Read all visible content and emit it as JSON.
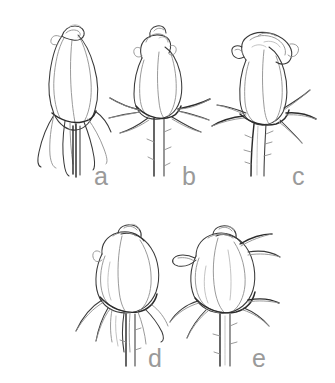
{
  "figure": {
    "kind": "botanical-line-drawing",
    "background_color": "#ffffff",
    "ink_color": "#3a3a3a",
    "soft_ink_color": "#8e8e8e",
    "label_color": "#9a9a9a",
    "panel_count": 5,
    "rows": [
      {
        "row": 1,
        "panels": [
          "a",
          "b",
          "c"
        ]
      },
      {
        "row": 2,
        "panels": [
          "d",
          "e"
        ]
      }
    ]
  },
  "panels": [
    {
      "id": "a",
      "label": "a",
      "stage": "tight elongated bud",
      "description": "slender pointed bud, petals fully closed, long sepals drooping downward along the receptacle",
      "sepals": "reflexed downward, elongate and narrow",
      "stem": "straight, short, no visible thorns",
      "label_x": 96,
      "label_y": 165
    },
    {
      "id": "b",
      "label": "b",
      "stage": "bud with outspread sepals",
      "description": "ovoid bud with petal tips beginning to separate at apex, sepals radiating horizontally outward",
      "sepals": "spreading horizontally, star-like",
      "stem": "straight, thorned",
      "label_x": 182,
      "label_y": 165
    },
    {
      "id": "c",
      "label": "c",
      "stage": "opening bud, outer petals reflexing",
      "description": "outer petals unfurling and curling outward at the top, sepals turned down, most advanced stage",
      "sepals": "reflexed downward and outward",
      "stem": "thorned, slightly curved",
      "label_x": 289,
      "label_y": 165
    },
    {
      "id": "d",
      "label": "d",
      "stage": "rounded globular bud",
      "description": "short, broad, rounded bud with overlapping petals, sepals hanging loosely below",
      "sepals": "drooping, broad and leafy",
      "stem": "straight, thorned",
      "label_x": 148,
      "label_y": 348
    },
    {
      "id": "e",
      "label": "e",
      "stage": "bud with recurved sepals",
      "description": "rounded bud viewed at an angle, petals overlapping spirally, sepals strongly recurved and spreading",
      "sepals": "recurved, spreading upward and outward",
      "stem": "straight, thorned",
      "label_x": 252,
      "label_y": 348
    }
  ]
}
